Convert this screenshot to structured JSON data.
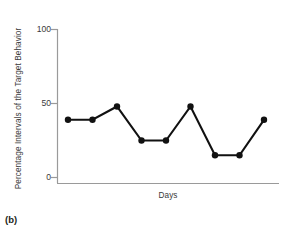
{
  "figure": {
    "caption": "(b)"
  },
  "chart_data": {
    "type": "line",
    "title": "",
    "xlabel": "Days",
    "ylabel": "Percentage Intervals of the Target Behavior",
    "x": [
      1,
      2,
      3,
      4,
      5,
      6,
      7,
      8,
      9
    ],
    "values": [
      39,
      39,
      48,
      25,
      25,
      48,
      15,
      15,
      39
    ],
    "series": [
      {
        "name": "Target Behavior",
        "values": [
          39,
          39,
          48,
          25,
          25,
          48,
          15,
          15,
          39
        ]
      }
    ],
    "ylim": [
      0,
      100
    ],
    "yticks": [
      0,
      50,
      100
    ],
    "ytick_labels": [
      "0",
      "50",
      "100"
    ],
    "xticks": [],
    "xtick_labels": [],
    "grid": false,
    "legend": false,
    "marker": "circle",
    "line_color": "#111111",
    "marker_color": "#111111",
    "axis_color": "#9a9a9a"
  }
}
